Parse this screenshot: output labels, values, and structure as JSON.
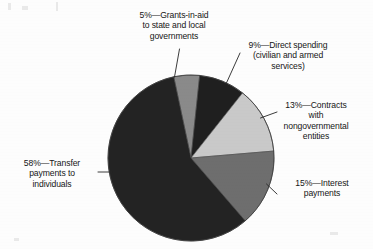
{
  "chart_data": {
    "type": "pie",
    "title": "",
    "subtitle": "",
    "xlabel": "",
    "ylabel": "",
    "legend_position": "none",
    "grid": false,
    "units": "percent",
    "total": 100,
    "categories": [
      "Grants-in-aid to state and local governments",
      "Direct spending (civilian and armed services)",
      "Contracts with nongovernmental entities",
      "Interest payments",
      "Transfer payments to individuals"
    ],
    "values": [
      5,
      9,
      13,
      15,
      58
    ],
    "colors": [
      "#8a8a8a",
      "#1f1f1f",
      "#c9c9c9",
      "#6e6e6e",
      "#232323"
    ],
    "slices": [
      {
        "percent": 5,
        "percent_text": "5%",
        "name": "Grants-in-aid to state and local governments",
        "color": "#8a8a8a",
        "start_angle": -12,
        "end_angle": 6
      },
      {
        "percent": 9,
        "percent_text": "9%",
        "name": "Direct spending (civilian and armed services)",
        "color": "#1f1f1f",
        "start_angle": 6,
        "end_angle": 38.4
      },
      {
        "percent": 13,
        "percent_text": "13%",
        "name": "Contracts with nongovernmental entities",
        "color": "#c9c9c9",
        "start_angle": 38.4,
        "end_angle": 85.2
      },
      {
        "percent": 15,
        "percent_text": "15%",
        "name": "Interest payments",
        "color": "#6e6e6e",
        "start_angle": 85.2,
        "end_angle": 139.2
      },
      {
        "percent": 58,
        "percent_text": "58%",
        "name": "Transfer payments to individuals",
        "color": "#232323",
        "start_angle": 139.2,
        "end_angle": 348
      }
    ]
  },
  "labels": {
    "grants": "5%—Grants-in-aid\nto state and local\ngovernments",
    "direct": "9%—Direct spending\n(civilian and armed\nservices)",
    "contracts": "13%—Contracts\nwith\nnongovernmental\nentities",
    "interest": "15%—Interest\npayments",
    "transfer": "58%—Transfer\npayments to\nindividuals"
  }
}
